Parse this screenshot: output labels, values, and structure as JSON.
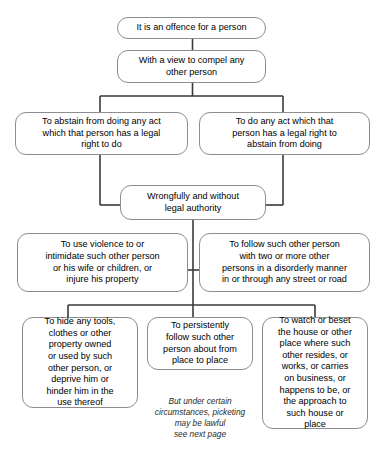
{
  "diagram": {
    "line_color": "#3a3a3a",
    "box_border_color": "#8e8e8e",
    "text_color": "#000000",
    "nodes": {
      "offence": "It is an offence for a person",
      "with_view": "With a view to compel any\nother person",
      "abstain": "To abstain from doing any act\nwhich that person has a legal\nright to do",
      "do_act": "To do any act which that\nperson has a legal right to\nabstain from doing",
      "wrongfully": "Wrongfully and without\nlegal authority",
      "violence": "To use violence to or\nintimidate such other person\nor his wife or children, or\ninjure his property",
      "follow_disorderly": "To follow such other person\nwith two or more other\npersons in a disorderly manner\nin or through any street or road",
      "hide_tools": "To hide any tools,\nclothes or other\nproperty owned\nor used by such\nother person, or\ndeprive him or\nhinder him in the\nuse thereof",
      "persistently_follow": "To persistently\nfollow such other\nperson about from\nplace to place",
      "watch_beset": "To watch or beset\nthe house or other\nplace where such\nother resides, or\nworks, or carries\non business, or\nhappens to be, or\nthe approach to\nsuch house or\nplace"
    },
    "note": "But under certain\ncircumstances, picketing\nmay be lawful\nsee next page"
  }
}
